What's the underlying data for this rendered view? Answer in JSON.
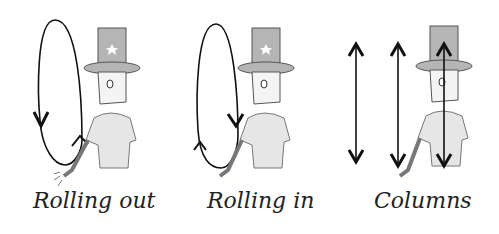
{
  "figure": {
    "panels": [
      {
        "id": "rolling-out",
        "caption": "Rolling out",
        "motion": "loop-counterclockwise"
      },
      {
        "id": "rolling-in",
        "caption": "Rolling in",
        "motion": "loop-clockwise"
      },
      {
        "id": "columns",
        "caption": "Columns",
        "motion": "vertical-up-down"
      }
    ]
  },
  "colors": {
    "stroke": "#111111",
    "figure_fill": "#e6e6e6",
    "hat_fill": "#b5b5b5",
    "background": "#ffffff"
  }
}
